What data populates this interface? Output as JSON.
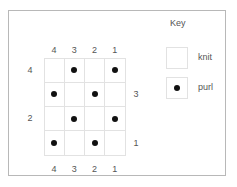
{
  "chart_data": {
    "type": "heatmap",
    "title": "",
    "rows": 4,
    "columns": 4,
    "cell_symbols": [
      "knit",
      "purl"
    ],
    "grid": [
      [
        "knit",
        "purl",
        "knit",
        "purl"
      ],
      [
        "purl",
        "knit",
        "purl",
        "knit"
      ],
      [
        "knit",
        "purl",
        "knit",
        "purl"
      ],
      [
        "purl",
        "knit",
        "purl",
        "knit"
      ]
    ],
    "column_labels_top": [
      "4",
      "3",
      "2",
      "1"
    ],
    "column_labels_bottom": [
      "4",
      "3",
      "2",
      "1"
    ],
    "row_labels_left": [
      "4",
      "",
      "2",
      ""
    ],
    "row_labels_right": [
      "",
      "3",
      "",
      "1"
    ],
    "colors": {
      "dot": "#111111",
      "grid_line": "#e2e2e2",
      "frame": "#b8b8b8",
      "text": "#555555",
      "background": "#ffffff"
    }
  },
  "chart": {
    "column_labels_top": [
      "4",
      "3",
      "2",
      "1"
    ],
    "column_labels_bottom": [
      "4",
      "3",
      "2",
      "1"
    ],
    "row_label_left_1": "4",
    "row_label_left_3": "2",
    "row_label_right_2": "3",
    "row_label_right_4": "1"
  },
  "key": {
    "title": "Key",
    "entries": [
      {
        "symbol": "empty-square",
        "label": "knit"
      },
      {
        "symbol": "dot-square",
        "label": "purl"
      }
    ],
    "knit_label": "knit",
    "purl_label": "purl"
  }
}
